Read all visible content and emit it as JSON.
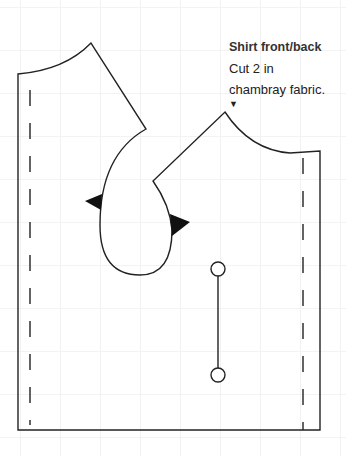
{
  "label": {
    "title": "Shirt front/back",
    "line1": "Cut 2 in",
    "line2": "chambray fabric.",
    "arrow": "▼"
  },
  "diagram": {
    "type": "sewing-pattern",
    "pieces": [
      "left-shirt-piece",
      "right-shirt-piece"
    ],
    "colors": {
      "stroke": "#222222",
      "background": "#ffffff",
      "grid": "#f1f1f1"
    },
    "markings": [
      "grainline-dashes",
      "notches",
      "button-placement-line"
    ]
  }
}
